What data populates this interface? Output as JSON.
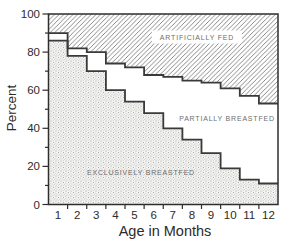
{
  "labels": {
    "artificially_fed": "ARTIFICIALLY FED",
    "partially_breastfed": "PARTIALLY BREASTFED",
    "exclusively_breastfed": "EXCLUSIVELY BREASTFED",
    "y_axis": "Percent",
    "x_axis": "Age in Months"
  },
  "colors": {
    "background": "#ffffff",
    "axis": "#2e2e2e",
    "step_line": "#3a3a3a",
    "hatch_line": "#7d7d7d",
    "stipple_dot": "#9a9a9a",
    "stipple_bg": "#f3f3f1",
    "tick_text": "#2b2b2b",
    "region_label_text": "#6e6e6e"
  },
  "chart_data": {
    "type": "area",
    "subtype": "stacked-step-area",
    "title": "",
    "xlabel": "Age in Months",
    "ylabel": "Percent",
    "x_categories": [
      1,
      2,
      3,
      4,
      5,
      6,
      7,
      8,
      9,
      10,
      11,
      12
    ],
    "xlim": [
      0.5,
      12.5
    ],
    "ylim": [
      0,
      100
    ],
    "y_ticks_major": [
      0,
      20,
      40,
      60,
      80,
      100
    ],
    "y_ticks_minor": [
      10,
      30,
      50,
      70,
      90
    ],
    "grid": false,
    "legend_position": "labels-inside-regions",
    "series": [
      {
        "name": "Total breastfed boundary (top of PARTIALLY BREASTFED / bottom of ARTIFICIALLY FED)",
        "values": [
          90,
          82,
          80,
          74,
          72,
          68,
          67,
          65,
          64,
          61,
          57,
          53
        ]
      },
      {
        "name": "EXCLUSIVELY BREASTFED",
        "values": [
          86,
          78,
          70,
          60,
          54,
          48,
          40,
          34,
          27,
          19,
          13,
          11
        ]
      }
    ],
    "regions": [
      {
        "name": "ARTIFICIALLY FED",
        "fill": "diagonal-hatch",
        "between": "total-breastfed-boundary and 100"
      },
      {
        "name": "PARTIALLY BREASTFED",
        "fill": "white",
        "between": "exclusively-breastfed and total-breastfed-boundary"
      },
      {
        "name": "EXCLUSIVELY BREASTFED",
        "fill": "stipple",
        "between": "0 and exclusively-breastfed"
      }
    ]
  }
}
